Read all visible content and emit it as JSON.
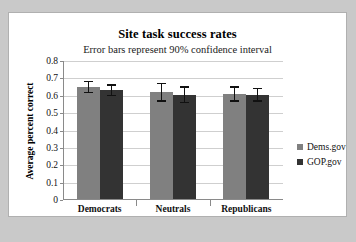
{
  "chart_data": {
    "type": "bar",
    "title": "Site task success rates",
    "subtitle": "Error bars represent 90% confidence interval",
    "xlabel": "",
    "ylabel": "Average percent correct",
    "ylim": [
      0,
      0.8
    ],
    "ytick_labels": [
      "0.8",
      "0.7",
      "0.6",
      "0.5",
      "0.4",
      "0.3",
      "0.2",
      "0.1",
      "0"
    ],
    "ytick_values": [
      0.8,
      0.7,
      0.6,
      0.5,
      0.4,
      0.3,
      0.2,
      0.1,
      0
    ],
    "grid": true,
    "legend_position": "right",
    "categories": [
      "Democrats",
      "Neutrals",
      "Republicans"
    ],
    "series": [
      {
        "name": "Dems.gov",
        "color": "#808080",
        "values": [
          0.645,
          0.615,
          0.605
        ],
        "errors": [
          0.035,
          0.055,
          0.045
        ]
      },
      {
        "name": "GOP.gov",
        "color": "#333333",
        "values": [
          0.625,
          0.6,
          0.6
        ],
        "errors": [
          0.035,
          0.05,
          0.04
        ]
      }
    ]
  },
  "legend": {
    "items": [
      {
        "label": "Dems.gov",
        "color": "#808080"
      },
      {
        "label": "GOP.gov",
        "color": "#333333"
      }
    ]
  },
  "colors": {
    "page_background": "#c9c9c9",
    "panel_background": "#ffffff",
    "panel_border": "#b0b0b0",
    "gridline": "#cfcfcf",
    "axis": "#8a8a8a",
    "errorbar": "#111111"
  }
}
